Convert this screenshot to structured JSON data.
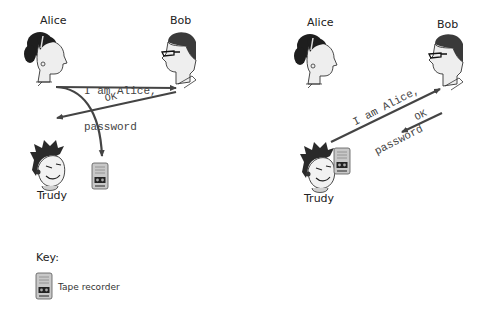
{
  "left_scenario": {
    "alice_label": "Alice",
    "bob_label": "Bob",
    "trudy_label": "Trudy",
    "message_line1": "I am Alice,",
    "message_line2": "password",
    "reply": "OK"
  },
  "right_scenario": {
    "alice_label": "Alice",
    "bob_label": "Bob",
    "trudy_label": "Trudy",
    "message_line1": "I am Alice,",
    "message_line2": "password",
    "reply": "OK"
  },
  "key": {
    "title": "Key:",
    "items": [
      {
        "icon": "tape-recorder-icon",
        "label": "Tape recorder"
      }
    ]
  },
  "colors": {
    "arrow": "#444444",
    "hair": "#1e1e1e",
    "skin": "#eeeeee",
    "device": "#bcbcbc"
  }
}
